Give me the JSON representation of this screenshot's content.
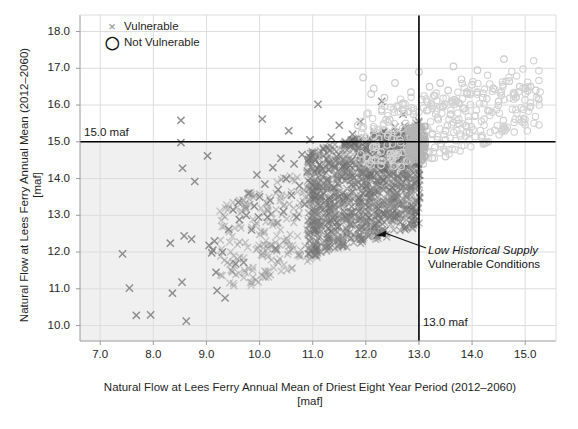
{
  "chart_data": {
    "type": "scatter",
    "title": "",
    "xlabel": "Natural Flow at Lees Ferry Annual Mean of Driest Eight Year Period (2012–2060) [maf]",
    "xlabel_line1": "Natural Flow at Lees Ferry Annual Mean of Driest Eight Year Period (2012–2060)",
    "xlabel_line2": "[maf]",
    "ylabel": "Natural Flow at Lees Ferry Annual Mean (2012–2060) [maf]",
    "ylabel_line1": "Natural Flow at Lees Ferry Annual Mean (2012–2060)",
    "ylabel_line2": "[maf]",
    "xlim": [
      6.62,
      15.58
    ],
    "ylim": [
      9.58,
      18.45
    ],
    "xticks": [
      "7.0",
      "8.0",
      "9.0",
      "10.0",
      "11.0",
      "12.0",
      "13.0",
      "14.0",
      "15.0"
    ],
    "xtick_values": [
      7.0,
      8.0,
      9.0,
      10.0,
      11.0,
      12.0,
      13.0,
      14.0,
      15.0
    ],
    "yticks": [
      "10.0",
      "11.0",
      "12.0",
      "13.0",
      "14.0",
      "15.0",
      "16.0",
      "17.0",
      "18.0"
    ],
    "ytick_values": [
      10.0,
      11.0,
      12.0,
      13.0,
      14.0,
      15.0,
      16.0,
      17.0,
      18.0
    ],
    "grid": true,
    "legend_position": "top-left",
    "legend": [
      {
        "label": "Vulnerable",
        "marker": "x",
        "color": "#8d8d8d"
      },
      {
        "label": "Not Vulnerable",
        "marker": "o",
        "color": "#111111"
      }
    ],
    "threshold_lines": [
      {
        "orientation": "horizontal",
        "value": 15.0,
        "label": "15.0 maf",
        "color": "#000000"
      },
      {
        "orientation": "vertical",
        "value": 13.0,
        "label": "13.0 maf",
        "color": "#000000"
      }
    ],
    "shaded_region": {
      "description": "Low Historical Supply Vulnerable Conditions quadrant",
      "x_range": [
        6.62,
        13.0
      ],
      "y_range": [
        9.58,
        15.0
      ],
      "color": "#f0f0f0"
    },
    "annotation": {
      "line1": "Low Historical Supply",
      "line2": "Vulnerable Conditions",
      "line1_style": "italic",
      "arrow_to": [
        12.2,
        12.45
      ]
    },
    "series": [
      {
        "name": "Vulnerable",
        "marker": "x",
        "color": "#7c7c7c",
        "points": [
          [
            7.42,
            11.95
          ],
          [
            7.55,
            11.02
          ],
          [
            7.68,
            10.28
          ],
          [
            7.95,
            10.29
          ],
          [
            8.32,
            12.24
          ],
          [
            8.36,
            10.88
          ],
          [
            8.52,
            15.58
          ],
          [
            8.54,
            11.18
          ],
          [
            8.58,
            12.44
          ],
          [
            8.62,
            10.12
          ],
          [
            8.72,
            12.35
          ],
          [
            8.78,
            13.92
          ],
          [
            8.55,
            14.28
          ],
          [
            8.52,
            14.98
          ],
          [
            9.02,
            14.62
          ],
          [
            9.05,
            12.18
          ],
          [
            9.1,
            11.98
          ],
          [
            9.12,
            12.05
          ],
          [
            9.15,
            12.3
          ],
          [
            9.18,
            11.45
          ],
          [
            9.2,
            10.95
          ],
          [
            9.35,
            10.75
          ],
          [
            9.3,
            12.0
          ],
          [
            9.42,
            12.62
          ],
          [
            9.5,
            13.15
          ],
          [
            9.55,
            11.68
          ],
          [
            9.6,
            13.35
          ],
          [
            9.62,
            12.88
          ],
          [
            9.7,
            11.72
          ],
          [
            9.75,
            13.0
          ],
          [
            9.8,
            13.6
          ],
          [
            9.85,
            12.6
          ],
          [
            9.9,
            13.25
          ],
          [
            9.95,
            14.1
          ],
          [
            9.98,
            12.95
          ],
          [
            10.0,
            13.5
          ],
          [
            10.05,
            15.62
          ],
          [
            10.1,
            13.85
          ],
          [
            10.15,
            12.95
          ],
          [
            10.2,
            13.4
          ],
          [
            10.25,
            14.3
          ],
          [
            10.3,
            12.1
          ],
          [
            10.35,
            13.7
          ],
          [
            10.4,
            14.55
          ],
          [
            10.45,
            13.1
          ],
          [
            10.5,
            14.0
          ],
          [
            10.55,
            15.3
          ],
          [
            10.6,
            13.55
          ],
          [
            10.65,
            14.4
          ],
          [
            10.7,
            12.95
          ],
          [
            10.75,
            13.8
          ],
          [
            10.8,
            14.65
          ],
          [
            10.85,
            13.3
          ],
          [
            10.9,
            14.2
          ],
          [
            10.95,
            15.05
          ],
          [
            11.0,
            13.65
          ],
          [
            11.05,
            14.5
          ],
          [
            11.1,
            16.02
          ],
          [
            11.15,
            13.95
          ],
          [
            11.2,
            14.8
          ],
          [
            11.25,
            13.4
          ],
          [
            11.3,
            14.25
          ],
          [
            11.35,
            15.12
          ],
          [
            11.4,
            13.75
          ],
          [
            11.45,
            14.6
          ],
          [
            11.5,
            15.45
          ],
          [
            11.55,
            14.05
          ],
          [
            11.6,
            14.9
          ],
          [
            11.65,
            13.5
          ],
          [
            11.7,
            14.35
          ],
          [
            11.75,
            15.2
          ],
          [
            11.8,
            13.85
          ],
          [
            11.85,
            14.7
          ],
          [
            11.9,
            15.55
          ],
          [
            11.95,
            14.15
          ],
          [
            12.0,
            15.0
          ],
          [
            12.05,
            13.6
          ],
          [
            12.1,
            14.45
          ],
          [
            12.15,
            15.3
          ],
          [
            12.2,
            13.95
          ],
          [
            12.25,
            14.8
          ],
          [
            12.3,
            16.1
          ],
          [
            12.35,
            14.25
          ],
          [
            12.4,
            15.1
          ],
          [
            12.45,
            13.7
          ],
          [
            12.5,
            14.55
          ],
          [
            12.55,
            15.4
          ],
          [
            12.6,
            14.05
          ],
          [
            12.65,
            14.9
          ],
          [
            12.7,
            15.75
          ],
          [
            12.75,
            14.35
          ],
          [
            12.8,
            15.2
          ],
          [
            12.85,
            13.8
          ],
          [
            12.9,
            14.65
          ],
          [
            12.95,
            15.5
          ],
          [
            13.0,
            14.1
          ]
        ]
      },
      {
        "name": "Not Vulnerable",
        "marker": "o",
        "color": "#cdcdcd",
        "points": [
          [
            11.95,
            16.75
          ],
          [
            12.1,
            16.3
          ],
          [
            12.15,
            16.45
          ],
          [
            12.3,
            15.88
          ],
          [
            12.35,
            16.2
          ],
          [
            12.45,
            15.6
          ],
          [
            12.55,
            16.6
          ],
          [
            12.6,
            15.95
          ],
          [
            12.7,
            16.05
          ],
          [
            12.75,
            15.5
          ],
          [
            12.85,
            16.35
          ],
          [
            12.9,
            15.75
          ],
          [
            13.0,
            16.9
          ],
          [
            13.05,
            16.15
          ],
          [
            13.1,
            15.4
          ],
          [
            13.15,
            15.85
          ],
          [
            13.2,
            16.5
          ],
          [
            13.25,
            15.2
          ],
          [
            13.3,
            16.25
          ],
          [
            13.35,
            15.65
          ],
          [
            13.4,
            16.6
          ],
          [
            13.45,
            15.95
          ],
          [
            13.5,
            15.3
          ],
          [
            13.55,
            16.4
          ],
          [
            13.6,
            15.75
          ],
          [
            13.65,
            17.05
          ],
          [
            13.7,
            16.1
          ],
          [
            13.75,
            15.5
          ],
          [
            13.8,
            16.7
          ],
          [
            13.85,
            15.9
          ],
          [
            13.9,
            16.35
          ],
          [
            13.95,
            15.25
          ],
          [
            14.0,
            16.55
          ],
          [
            14.05,
            15.7
          ],
          [
            14.1,
            16.95
          ],
          [
            14.2,
            16.2
          ],
          [
            14.3,
            15.85
          ],
          [
            14.4,
            16.45
          ],
          [
            14.5,
            16.1
          ],
          [
            14.6,
            17.25
          ],
          [
            14.7,
            16.65
          ],
          [
            14.8,
            16.3
          ],
          [
            14.9,
            16.5
          ],
          [
            15.0,
            16.45
          ],
          [
            15.1,
            16.5
          ],
          [
            15.2,
            16.4
          ],
          [
            13.12,
            14.95
          ],
          [
            13.18,
            14.7
          ],
          [
            13.25,
            14.55
          ],
          [
            13.3,
            14.85
          ],
          [
            13.08,
            14.4
          ],
          [
            13.35,
            15.05
          ],
          [
            12.9,
            14.8
          ],
          [
            12.95,
            14.5
          ],
          [
            13.42,
            14.95
          ],
          [
            13.5,
            14.6
          ],
          [
            12.6,
            14.9
          ],
          [
            12.5,
            15.1
          ],
          [
            12.2,
            15.25
          ],
          [
            11.85,
            15.45
          ]
        ]
      }
    ]
  }
}
